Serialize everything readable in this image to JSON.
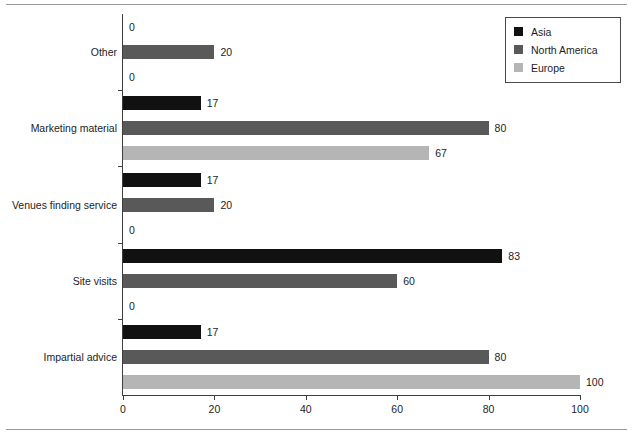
{
  "chart_data": {
    "type": "bar",
    "orientation": "horizontal",
    "title": "",
    "xlabel": "",
    "ylabel": "",
    "xlim": [
      0,
      100
    ],
    "xticks": [
      0,
      20,
      40,
      60,
      80,
      100
    ],
    "grid": false,
    "legend_position": "top-right",
    "categories": [
      "Other",
      "Marketing material",
      "Venues finding service",
      "Site visits",
      "Impartial advice"
    ],
    "series": [
      {
        "name": "Asia",
        "color": "#111111",
        "values": [
          0,
          17,
          17,
          83,
          17
        ]
      },
      {
        "name": "North America",
        "color": "#595959",
        "values": [
          20,
          80,
          20,
          60,
          80
        ]
      },
      {
        "name": "Europe",
        "color": "#b5b5b5",
        "values": [
          0,
          67,
          0,
          0,
          100
        ]
      }
    ],
    "data_labels": [
      {
        "category": "Other",
        "series": "Asia",
        "value": 0
      },
      {
        "category": "Other",
        "series": "North America",
        "value": 20
      },
      {
        "category": "Other",
        "series": "Europe",
        "value": 0
      },
      {
        "category": "Marketing material",
        "series": "Asia",
        "value": 17
      },
      {
        "category": "Marketing material",
        "series": "North America",
        "value": 80
      },
      {
        "category": "Marketing material",
        "series": "Europe",
        "value": 67
      },
      {
        "category": "Venues finding service",
        "series": "Asia",
        "value": 17
      },
      {
        "category": "Venues finding service",
        "series": "North America",
        "value": 20
      },
      {
        "category": "Venues finding service",
        "series": "Europe",
        "value": 0
      },
      {
        "category": "Site visits",
        "series": "Asia",
        "value": 83
      },
      {
        "category": "Site visits",
        "series": "North America",
        "value": 60
      },
      {
        "category": "Site visits",
        "series": "Europe",
        "value": 0
      },
      {
        "category": "Impartial advice",
        "series": "Asia",
        "value": 17
      },
      {
        "category": "Impartial advice",
        "series": "North America",
        "value": 80
      },
      {
        "category": "Impartial advice",
        "series": "Europe",
        "value": 100
      }
    ]
  },
  "legend": {
    "entries": [
      {
        "label": "Asia",
        "color": "#111111",
        "swatch": "square-swatch"
      },
      {
        "label": "North America",
        "color": "#595959",
        "swatch": "square-swatch"
      },
      {
        "label": "Europe",
        "color": "#b5b5b5",
        "swatch": "square-swatch"
      }
    ]
  },
  "axis": {
    "x_tick_labels": [
      "0",
      "20",
      "40",
      "60",
      "80",
      "100"
    ]
  }
}
